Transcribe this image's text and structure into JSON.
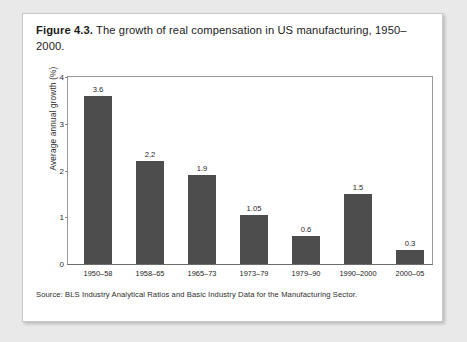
{
  "caption": {
    "label": "Figure 4.3.",
    "text": "The growth of real compensation in US manufacturing, 1950–2000."
  },
  "source": "Source: BLS Industry Analytical Ratios and Basic Industry Data for the Manufacturing Sector.",
  "colors": {
    "bar": "#4d4d4d",
    "page": "#ffffff",
    "backdrop": "#e9e9e9",
    "axis": "#9a9a9a"
  },
  "chart_data": {
    "type": "bar",
    "title": "The growth of real compensation in US manufacturing, 1950–2000.",
    "xlabel": "",
    "ylabel": "Average annual growth (%)",
    "categories": [
      "1950–58",
      "1958–65",
      "1965–73",
      "1973–79",
      "1979–90",
      "1990–2000",
      "2000–05"
    ],
    "values": [
      3.6,
      2.2,
      1.9,
      1.05,
      0.6,
      1.5,
      0.3
    ],
    "value_labels": [
      "3.6",
      "2.2",
      "1.9",
      "1.05",
      "0.6",
      "1.5",
      "0.3"
    ],
    "ylim": [
      0,
      4
    ],
    "yticks": [
      0,
      1,
      2,
      3,
      4
    ],
    "ytick_labels": [
      "0",
      "1",
      "2",
      "3",
      "4"
    ],
    "grid": false,
    "legend": false
  }
}
